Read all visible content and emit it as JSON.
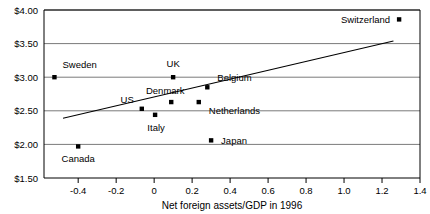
{
  "chart_data": {
    "type": "scatter",
    "title": "",
    "xlabel": "Net foreign assets/GDP in 1996",
    "ylabel": "",
    "xlim": [
      -0.58,
      1.4
    ],
    "ylim": [
      1.5,
      4.0
    ],
    "grid": true,
    "legend": "none",
    "xticks": [
      "-0.4",
      "-0.2",
      "0",
      "0.2",
      "0.4",
      "0.6",
      "0.8",
      "1.0",
      "1.2",
      "1.4"
    ],
    "xtick_values": [
      -0.4,
      -0.2,
      0,
      0.2,
      0.4,
      0.6,
      0.8,
      1.0,
      1.2,
      1.4
    ],
    "yticks": [
      "$1.50",
      "$2.00",
      "$2.50",
      "$3.00",
      "$3.50",
      "$4.00"
    ],
    "ytick_values": [
      1.5,
      2.0,
      2.5,
      3.0,
      3.5,
      4.0
    ],
    "points": [
      {
        "label": "Sweden",
        "x": -0.525,
        "y": 3.0,
        "label_dx": 8,
        "label_dy": -9,
        "label_anchor": "start"
      },
      {
        "label": "Canada",
        "x": -0.4,
        "y": 1.97,
        "label_dx": 0,
        "label_dy": 16,
        "label_anchor": "middle"
      },
      {
        "label": "US",
        "x": -0.065,
        "y": 2.53,
        "label_dx": -8,
        "label_dy": -6,
        "label_anchor": "end"
      },
      {
        "label": "Italy",
        "x": 0.005,
        "y": 2.44,
        "label_dx": 1,
        "label_dy": 16,
        "label_anchor": "middle"
      },
      {
        "label": "Denmark",
        "x": 0.09,
        "y": 2.63,
        "label_dx": -6,
        "label_dy": -8,
        "label_anchor": "middle"
      },
      {
        "label": "UK",
        "x": 0.1,
        "y": 3.0,
        "label_dx": 0,
        "label_dy": -10,
        "label_anchor": "middle"
      },
      {
        "label": "Netherlands",
        "x": 0.235,
        "y": 2.63,
        "label_dx": 10,
        "label_dy": 12,
        "label_anchor": "start"
      },
      {
        "label": "Belgium",
        "x": 0.28,
        "y": 2.85,
        "label_dx": 10,
        "label_dy": -6,
        "label_anchor": "start"
      },
      {
        "label": "Japan",
        "x": 0.3,
        "y": 2.06,
        "label_dx": 10,
        "label_dy": 4,
        "label_anchor": "start"
      },
      {
        "label": "Switzerland",
        "x": 1.29,
        "y": 3.86,
        "label_dx": -9,
        "label_dy": 4,
        "label_anchor": "end"
      }
    ],
    "trendline": {
      "x0": -0.48,
      "y0": 2.39,
      "x1": 1.26,
      "y1": 3.54
    }
  },
  "colors": {
    "axis": "#000000",
    "grid": "#7a7a7a",
    "marker": "#000000",
    "trend": "#000000",
    "background": "#ffffff"
  }
}
